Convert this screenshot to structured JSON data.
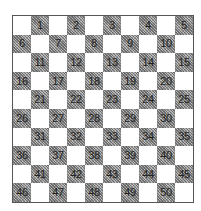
{
  "board": {
    "size": 10,
    "colors": {
      "light": "#ffffff",
      "dark": "#9a9a9a",
      "border": "#555555",
      "text": "#222222"
    },
    "squares": [
      [
        null,
        1,
        null,
        2,
        null,
        3,
        null,
        4,
        null,
        5
      ],
      [
        6,
        null,
        7,
        null,
        8,
        null,
        9,
        null,
        10,
        null
      ],
      [
        null,
        11,
        null,
        12,
        null,
        13,
        null,
        14,
        null,
        15
      ],
      [
        16,
        null,
        17,
        null,
        18,
        null,
        19,
        null,
        20,
        null
      ],
      [
        null,
        21,
        null,
        22,
        null,
        23,
        null,
        24,
        null,
        25
      ],
      [
        26,
        null,
        27,
        null,
        28,
        null,
        29,
        null,
        30,
        null
      ],
      [
        null,
        31,
        null,
        32,
        null,
        33,
        null,
        34,
        null,
        35
      ],
      [
        36,
        null,
        37,
        null,
        38,
        null,
        39,
        null,
        40,
        null
      ],
      [
        null,
        41,
        null,
        42,
        null,
        43,
        null,
        44,
        null,
        45
      ],
      [
        46,
        null,
        47,
        null,
        48,
        null,
        49,
        null,
        50,
        null
      ]
    ]
  }
}
